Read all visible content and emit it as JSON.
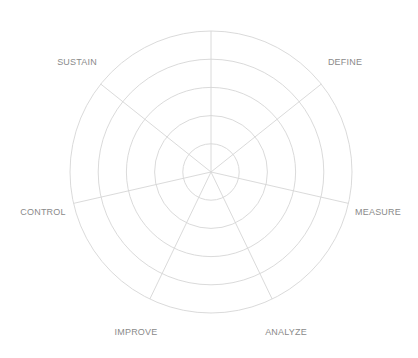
{
  "diagram": {
    "type": "radar-grid",
    "center": {
      "x": 211,
      "y": 172
    },
    "outer_radius": 141,
    "ring_count": 5,
    "spoke_count": 7,
    "start_angle_deg": 0,
    "colors": {
      "grid": "#d6d6d6",
      "label": "#8a8a8a",
      "background": "#ffffff"
    },
    "axes": [
      {
        "label": "",
        "angle_deg": 0
      },
      {
        "label": "DEFINE",
        "angle_deg": 51.43,
        "label_pos": {
          "x": 345,
          "y": 62
        }
      },
      {
        "label": "MEASURE",
        "angle_deg": 102.86,
        "label_pos": {
          "x": 378,
          "y": 212
        }
      },
      {
        "label": "ANALYZE",
        "angle_deg": 154.29,
        "label_pos": {
          "x": 286,
          "y": 332
        }
      },
      {
        "label": "IMPROVE",
        "angle_deg": 205.71,
        "label_pos": {
          "x": 136,
          "y": 332
        }
      },
      {
        "label": "CONTROL",
        "angle_deg": 257.14,
        "label_pos": {
          "x": 43,
          "y": 212
        }
      },
      {
        "label": "SUSTAIN",
        "angle_deg": 308.57,
        "label_pos": {
          "x": 77,
          "y": 62
        }
      }
    ]
  }
}
